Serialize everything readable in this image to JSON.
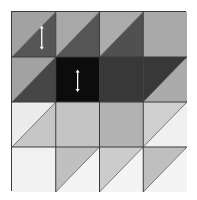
{
  "figure": {
    "title": "",
    "rows": 4,
    "cols": 4,
    "grid_line_color": "#3a3a3a",
    "diagonal_line_color": "#5a5a5a",
    "split_direction": "bottom-left to top-right",
    "cells": [
      [
        {
          "type": "split",
          "upper_left": "#a2a2a2",
          "lower_right": "#565656",
          "marker": "double-arrow-vertical"
        },
        {
          "type": "split",
          "upper_left": "#a8a8a8",
          "lower_right": "#555555"
        },
        {
          "type": "split",
          "upper_left": "#acacac",
          "lower_right": "#505050"
        },
        {
          "type": "solid",
          "fill": "#a9a9a9"
        }
      ],
      [
        {
          "type": "split",
          "upper_left": "#a2a2a2",
          "lower_right": "#464646"
        },
        {
          "type": "solid",
          "fill": "#0c0c0c",
          "marker": "double-arrow-vertical"
        },
        {
          "type": "solid",
          "fill": "#383838"
        },
        {
          "type": "split",
          "upper_left": "#383838",
          "lower_right": "#ababab"
        }
      ],
      [
        {
          "type": "split",
          "upper_left": "#ececec",
          "lower_right": "#c6c6c6"
        },
        {
          "type": "solid",
          "fill": "#c4c4c4"
        },
        {
          "type": "solid",
          "fill": "#b2b2b2"
        },
        {
          "type": "split",
          "upper_left": "#cfcfcf",
          "lower_right": "#f0f0f0"
        }
      ],
      [
        {
          "type": "solid",
          "fill": "#f1f1f1"
        },
        {
          "type": "split",
          "upper_left": "#c0c0c0",
          "lower_right": "#f4f4f4"
        },
        {
          "type": "split",
          "upper_left": "#cccccc",
          "lower_right": "#f4f4f4"
        },
        {
          "type": "split",
          "upper_left": "#bfbfbf",
          "lower_right": "#f4f4f4"
        }
      ]
    ],
    "markers": [
      {
        "row": 0,
        "col": 0,
        "icon": "double-arrow-vertical",
        "color": "#ffffff"
      },
      {
        "row": 1,
        "col": 1,
        "icon": "double-arrow-vertical",
        "color": "#ffffff"
      }
    ]
  }
}
